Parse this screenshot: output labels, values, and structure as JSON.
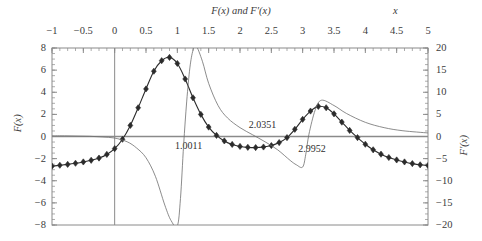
{
  "chart_data": {
    "type": "line",
    "title": "F(x) and F′(x)",
    "xlabel": "x",
    "ylabel_left": "F(x)",
    "ylabel_right": "F′(x)",
    "xlim": [
      -1,
      5
    ],
    "ylim_left": [
      -8,
      8
    ],
    "ylim_right": [
      -20,
      20
    ],
    "grid": false,
    "legend": "none",
    "xticks": [
      -1,
      -0.5,
      0,
      0.5,
      1,
      1.5,
      2,
      2.5,
      3,
      3.5,
      4,
      4.5,
      5
    ],
    "xtick_labels": [
      "−1",
      "−0.5",
      "0",
      "0.5",
      "1",
      "1.5",
      "2",
      "2.5",
      "3",
      "3.5",
      "4",
      "4.5",
      "5"
    ],
    "yticks_left": [
      -8,
      -6,
      -4,
      -2,
      0,
      2,
      4,
      6,
      8
    ],
    "ytick_labels_left": [
      "−8",
      "−6",
      "−4",
      "−2",
      "0",
      "2",
      "4",
      "6",
      "8"
    ],
    "yticks_right": [
      -20,
      -15,
      -10,
      -5,
      0,
      5,
      10,
      15,
      20
    ],
    "ytick_labels_right": [
      "−20",
      "−15",
      "−10",
      "−5",
      "0",
      "5",
      "10",
      "15",
      "20"
    ],
    "annotations": [
      {
        "text": "1.0011",
        "x": 1.18,
        "y": -0.85,
        "axis": "left"
      },
      {
        "text": "2.0351",
        "x": 2.36,
        "y": 1.05,
        "axis": "left"
      },
      {
        "text": "2.9952",
        "x": 3.15,
        "y": -1.15,
        "axis": "left"
      }
    ],
    "series": [
      {
        "name": "F(x)",
        "axis": "left",
        "marker": "diamond",
        "line": "solid",
        "x": [
          -1,
          -0.875,
          -0.75,
          -0.625,
          -0.5,
          -0.375,
          -0.25,
          -0.125,
          0,
          0.125,
          0.25,
          0.375,
          0.5,
          0.625,
          0.75,
          0.875,
          1,
          1.125,
          1.25,
          1.375,
          1.5,
          1.625,
          1.75,
          1.875,
          2,
          2.125,
          2.25,
          2.375,
          2.5,
          2.625,
          2.75,
          2.875,
          3,
          3.125,
          3.25,
          3.375,
          3.5,
          3.625,
          3.75,
          3.875,
          4,
          4.125,
          4.25,
          4.375,
          4.5,
          4.625,
          4.75,
          4.875,
          5
        ],
        "y": [
          -2.68,
          -2.6,
          -2.52,
          -2.42,
          -2.3,
          -2.15,
          -1.95,
          -1.62,
          -1.1,
          -0.25,
          1.0,
          2.6,
          4.3,
          5.9,
          6.85,
          7.15,
          6.6,
          5.2,
          3.5,
          2.0,
          0.85,
          0.1,
          -0.4,
          -0.72,
          -0.9,
          -0.98,
          -1.0,
          -0.95,
          -0.82,
          -0.55,
          -0.1,
          0.65,
          1.55,
          2.3,
          2.72,
          2.6,
          2.05,
          1.3,
          0.55,
          -0.1,
          -0.7,
          -1.2,
          -1.6,
          -1.9,
          -2.12,
          -2.3,
          -2.45,
          -2.56,
          -2.62
        ]
      },
      {
        "name": "F′(x)",
        "axis": "right",
        "marker": "none",
        "line": "thin",
        "x": [
          -1,
          -0.8,
          -0.6,
          -0.4,
          -0.2,
          0,
          0.2,
          0.35,
          0.5,
          0.65,
          0.8,
          0.9,
          1.0,
          1.05,
          1.1,
          1.15,
          1.2,
          1.25,
          1.3,
          1.4,
          1.5,
          1.65,
          1.8,
          2.0,
          2.2,
          2.4,
          2.6,
          2.8,
          2.9,
          3.0,
          3.05,
          3.1,
          3.2,
          3.3,
          3.5,
          3.7,
          4.0,
          4.3,
          4.6,
          5.0
        ],
        "y": [
          0.15,
          0.15,
          0.1,
          0.05,
          -0.1,
          -0.35,
          -1.2,
          -2.6,
          -4.8,
          -9.0,
          -15.5,
          -19.0,
          -20.2,
          -14.0,
          -2.0,
          8.0,
          15.5,
          19.5,
          20.5,
          17.0,
          12.0,
          7.0,
          4.2,
          2.0,
          0.4,
          -1.2,
          -3.0,
          -5.4,
          -6.4,
          -6.9,
          -4.0,
          0.5,
          6.0,
          8.2,
          7.0,
          5.2,
          3.2,
          2.0,
          1.3,
          0.8
        ]
      }
    ]
  },
  "axes": {
    "zero_vertical_line_x": 0,
    "zero_horizontal_line_y": 0
  },
  "colors": {
    "curve_marker": "#2b2b2b",
    "curve_thin": "#6e6e6e",
    "axis": "#8a8a8a",
    "text": "#3b3b3b",
    "background": "#ffffff"
  }
}
